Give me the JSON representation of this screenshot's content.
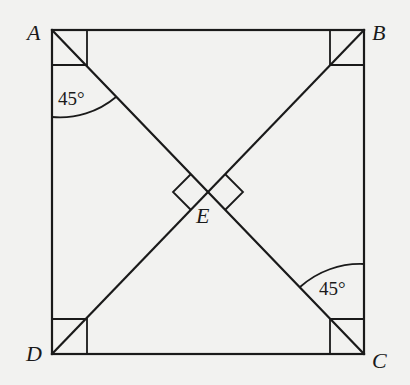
{
  "diagram": {
    "type": "geometry-square-with-diagonals",
    "vertices": {
      "A": {
        "label": "A",
        "x": 52,
        "y": 30
      },
      "B": {
        "label": "B",
        "x": 364,
        "y": 30
      },
      "C": {
        "label": "C",
        "x": 364,
        "y": 354
      },
      "D": {
        "label": "D",
        "x": 52,
        "y": 354
      },
      "E": {
        "label": "E",
        "x": 208,
        "y": 192
      }
    },
    "edges": [
      [
        "A",
        "B"
      ],
      [
        "B",
        "C"
      ],
      [
        "C",
        "D"
      ],
      [
        "D",
        "A"
      ]
    ],
    "diagonals": [
      [
        "A",
        "C"
      ],
      [
        "B",
        "D"
      ]
    ],
    "right_angle_markers": [
      "A",
      "B",
      "C",
      "D",
      "E-left",
      "E-right"
    ],
    "angle_labels": [
      {
        "vertex": "A",
        "text": "45°"
      },
      {
        "vertex": "C",
        "text": "45°"
      }
    ],
    "colors": {
      "line": "#1a1a1a",
      "background": "#f2f2f0"
    }
  }
}
